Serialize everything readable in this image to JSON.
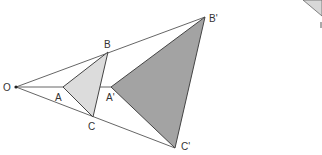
{
  "diagram": {
    "type": "homothety / dilation",
    "center_label": "O",
    "points": {
      "O": {
        "label": "O",
        "x": 16,
        "y": 87
      },
      "A": {
        "label": "A",
        "x": 63,
        "y": 87
      },
      "B": {
        "label": "B",
        "x": 108,
        "y": 52
      },
      "C": {
        "label": "C",
        "x": 93,
        "y": 117
      },
      "A2": {
        "label": "A'",
        "x": 111,
        "y": 87
      },
      "B2": {
        "label": "B'",
        "x": 205,
        "y": 17
      },
      "C2": {
        "label": "C'",
        "x": 175,
        "y": 148
      }
    },
    "label_positions": {
      "O": {
        "x": 3,
        "y": 91
      },
      "A": {
        "x": 55,
        "y": 101
      },
      "B": {
        "x": 104,
        "y": 48
      },
      "C": {
        "x": 88,
        "y": 130
      },
      "A2": {
        "x": 106,
        "y": 101
      },
      "B2": {
        "x": 209,
        "y": 22
      },
      "C2": {
        "x": 181,
        "y": 150
      }
    },
    "triangles": [
      {
        "name": "original",
        "vertices": [
          "A",
          "B",
          "C"
        ],
        "fill": "#dcdcdc",
        "stroke": "#444444"
      },
      {
        "name": "image",
        "vertices": [
          "A2",
          "B2",
          "C2"
        ],
        "fill": "#a3a3a3",
        "stroke": "#444444"
      }
    ],
    "rays": [
      {
        "from": "O",
        "to": "B2"
      },
      {
        "from": "O",
        "to": "A2"
      },
      {
        "from": "O",
        "to": "C2"
      }
    ],
    "colors": {
      "line": "#555555",
      "small_fill": "#dcdcdc",
      "large_fill": "#a3a3a3",
      "background": "#ffffff"
    },
    "fragment": {
      "description": "partial shape cut off at top-right edge",
      "fill": "#d8d8d8"
    }
  }
}
